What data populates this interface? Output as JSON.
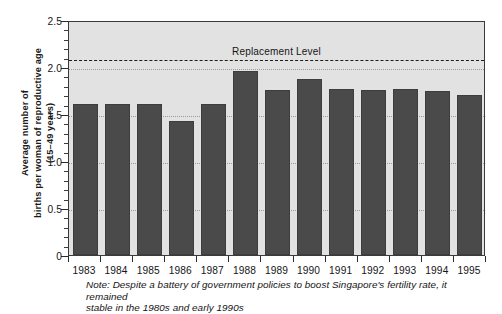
{
  "chart_data": {
    "type": "bar",
    "title": "",
    "subtitle": "",
    "xlabel": "",
    "ylabel_line1": "Average number of",
    "ylabel_line2": "births per woman of reproductive age",
    "ylabel_line3": "(15–49 years)",
    "categories": [
      "1983",
      "1984",
      "1985",
      "1986",
      "1987",
      "1988",
      "1989",
      "1990",
      "1991",
      "1992",
      "1993",
      "1994",
      "1995"
    ],
    "values": [
      1.61,
      1.61,
      1.61,
      1.43,
      1.61,
      1.96,
      1.76,
      1.87,
      1.77,
      1.76,
      1.77,
      1.74,
      1.7
    ],
    "ylim": [
      0,
      2.5
    ],
    "ytick_labels": [
      "0",
      "0.5",
      "1.0",
      "1.5",
      "2.0",
      "2.5"
    ],
    "ytick_values": [
      0,
      0.5,
      1.0,
      1.5,
      2.0,
      2.5
    ],
    "yminor_step": 0.1,
    "gridlines": [
      0.5,
      1.0,
      1.5,
      2.0
    ],
    "grid": true,
    "legend": "none",
    "annotations": [
      {
        "name": "replacement-level",
        "label": "Replacement Level",
        "value": 2.1,
        "style": "dashed",
        "label_x_category_index": 6.0
      }
    ],
    "bar_color": "#4a4a4a",
    "plot_background": "#e2e2e2",
    "axis_color": "#2b2b2b"
  },
  "note": {
    "line1": "Note:  Despite a battery of government policies to boost Singapore's fertility rate, it remained",
    "line2": "stable in the 1980s and early 1990s"
  }
}
